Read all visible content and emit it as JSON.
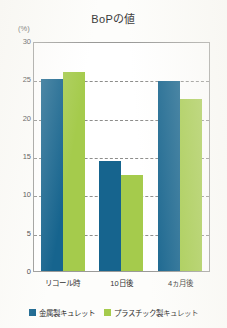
{
  "chart_data": {
    "type": "bar",
    "title": "BoPの値",
    "xlabel": "",
    "ylabel": "(%)",
    "unit_label": "(%)",
    "categories": [
      "リコール時",
      "10日後",
      "4ヵ月後"
    ],
    "series": [
      {
        "name": "金属製キュレット",
        "color": "#16648e",
        "values": [
          25.0,
          14.3,
          24.8
        ]
      },
      {
        "name": "プラスチック製キュレット",
        "color": "#a5cb4c",
        "values": [
          25.9,
          12.5,
          22.4
        ]
      }
    ],
    "ylim": [
      0,
      30
    ],
    "yticks": [
      30,
      25,
      20,
      15,
      10,
      5,
      0
    ],
    "grid": true,
    "legend_position": "bottom"
  },
  "legend": {
    "items": [
      {
        "label": "金属製キュレット",
        "color": "#16648e"
      },
      {
        "label": "プラスチック製キュレット",
        "color": "#a5cb4c"
      }
    ]
  },
  "colors": {
    "metal": "#16648e",
    "plastic": "#a5cb4c",
    "axis": "#9a9a98",
    "grid": "#8d8d8b",
    "text": "#2b2b2b",
    "background": "#fdfdfb"
  }
}
